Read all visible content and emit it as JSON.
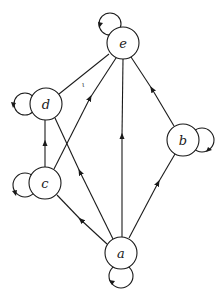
{
  "diagram": {
    "type": "directed-graph",
    "nodes": [
      {
        "id": "e",
        "label": "e",
        "x": 123,
        "y": 43
      },
      {
        "id": "d",
        "label": "d",
        "x": 46,
        "y": 104
      },
      {
        "id": "b",
        "label": "b",
        "x": 183,
        "y": 140
      },
      {
        "id": "c",
        "label": "c",
        "x": 45,
        "y": 183
      },
      {
        "id": "a",
        "label": "a",
        "x": 121,
        "y": 253
      }
    ],
    "edges": [
      {
        "from": "d",
        "to": "e",
        "directed": false
      },
      {
        "from": "c",
        "to": "e",
        "directed": true
      },
      {
        "from": "a",
        "to": "e",
        "directed": true
      },
      {
        "from": "b",
        "to": "e",
        "directed": true
      },
      {
        "from": "c",
        "to": "d",
        "directed": true
      },
      {
        "from": "a",
        "to": "d",
        "directed": true
      },
      {
        "from": "a",
        "to": "c",
        "directed": true
      },
      {
        "from": "a",
        "to": "b",
        "directed": true
      }
    ],
    "self_loops": [
      "a",
      "b",
      "c",
      "d",
      "e"
    ],
    "annotation_mark": "ι",
    "colors": {
      "stroke": "#1a1a1a",
      "background": "#ffffff"
    }
  }
}
